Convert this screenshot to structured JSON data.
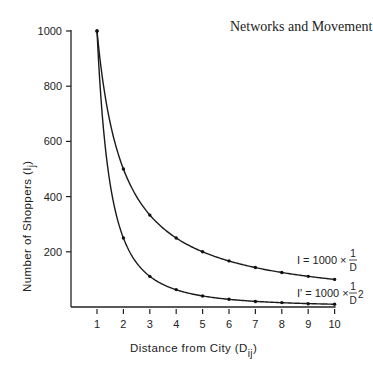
{
  "page": {
    "header_title": "Networks and Movement"
  },
  "chart_data": {
    "type": "line",
    "title": "",
    "xlabel": "Distance from City (Dij)",
    "ylabel": "Number of Shoppers (Ij)",
    "xlabel_main": "Distance from City (D",
    "xlabel_sub": "ij",
    "xlabel_close": ")",
    "ylabel_main": "Number of Shoppers (I",
    "ylabel_sub": "j",
    "ylabel_close": ")",
    "x": [
      1,
      2,
      3,
      4,
      5,
      6,
      7,
      8,
      9,
      10
    ],
    "x_ticks": [
      "1",
      "2",
      "3",
      "4",
      "5",
      "6",
      "7",
      "8",
      "9",
      "10"
    ],
    "y_ticks": [
      "200",
      "400",
      "600",
      "800",
      "1000"
    ],
    "xlim": [
      0,
      10
    ],
    "ylim": [
      0,
      1000
    ],
    "grid": false,
    "series": [
      {
        "name": "I = 1000 × 1/D",
        "formula_lhs": "I = 1000 ×",
        "formula_num": "1",
        "formula_den": "D",
        "values": [
          1000,
          500,
          333,
          250,
          200,
          167,
          143,
          125,
          111,
          100
        ]
      },
      {
        "name": "I' = 1000 × 1/D²",
        "formula_lhs": "I' = 1000 ×",
        "formula_num": "1",
        "formula_den": "D",
        "formula_exp": "2",
        "values": [
          1000,
          250,
          111,
          63,
          40,
          28,
          20,
          16,
          12,
          10
        ]
      }
    ],
    "legend_position": "inline-right"
  }
}
